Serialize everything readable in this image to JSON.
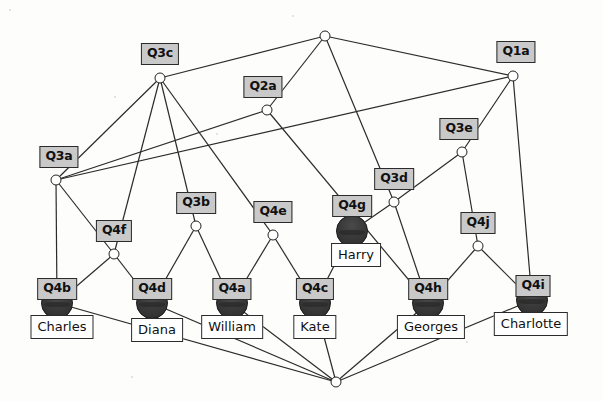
{
  "diagram": {
    "type": "graph",
    "colors": {
      "q_node_fill": "#c9c9c9",
      "name_node_fill": "#ffffff",
      "stroke": "#2b2b2b",
      "blob_fill": "#3a3a3a",
      "background": "#fdfdfb"
    },
    "nodes": [
      {
        "id": "top",
        "label": "",
        "kind": "junction",
        "x": 325,
        "y": 36,
        "label_x": 325,
        "label_y": 36
      },
      {
        "id": "Q3c",
        "label": "Q3c",
        "kind": "q",
        "x": 160,
        "y": 78,
        "label_x": 160,
        "label_y": 43
      },
      {
        "id": "Q1a",
        "label": "Q1a",
        "kind": "q",
        "x": 513,
        "y": 76,
        "label_x": 516,
        "label_y": 41
      },
      {
        "id": "Q2a",
        "label": "Q2a",
        "kind": "q",
        "x": 267,
        "y": 110,
        "label_x": 263,
        "label_y": 76
      },
      {
        "id": "Q3e",
        "label": "Q3e",
        "kind": "q",
        "x": 462,
        "y": 152,
        "label_x": 459,
        "label_y": 118
      },
      {
        "id": "Q3a",
        "label": "Q3a",
        "kind": "q",
        "x": 56,
        "y": 180,
        "label_x": 59,
        "label_y": 146
      },
      {
        "id": "Q3d",
        "label": "Q3d",
        "kind": "q",
        "x": 394,
        "y": 202,
        "label_x": 394,
        "label_y": 168
      },
      {
        "id": "Q3b",
        "label": "Q3b",
        "kind": "q",
        "x": 196,
        "y": 226,
        "label_x": 196,
        "label_y": 192
      },
      {
        "id": "Q4e",
        "label": "Q4e",
        "kind": "q",
        "x": 273,
        "y": 235,
        "label_x": 273,
        "label_y": 201
      },
      {
        "id": "Q4f",
        "label": "Q4f",
        "kind": "q",
        "x": 114,
        "y": 254,
        "label_x": 114,
        "label_y": 220
      },
      {
        "id": "Q4j",
        "label": "Q4j",
        "kind": "q",
        "x": 478,
        "y": 246,
        "label_x": 478,
        "label_y": 212
      },
      {
        "id": "Q4g",
        "label": "Q4g",
        "kind": "person",
        "x": 352,
        "y": 231,
        "label_x": 352,
        "label_y": 195,
        "name": "Harry",
        "name_x": 356,
        "name_y": 243
      },
      {
        "id": "Q4b",
        "label": "Q4b",
        "kind": "person",
        "x": 57,
        "y": 303,
        "label_x": 57,
        "label_y": 278,
        "name": "Charles",
        "name_x": 62,
        "name_y": 315
      },
      {
        "id": "Q4d",
        "label": "Q4d",
        "kind": "person",
        "x": 152,
        "y": 303,
        "label_x": 152,
        "label_y": 278,
        "name": "Diana",
        "name_x": 157,
        "name_y": 318
      },
      {
        "id": "Q4a",
        "label": "Q4a",
        "kind": "person",
        "x": 232,
        "y": 303,
        "label_x": 232,
        "label_y": 278,
        "name": "William",
        "name_x": 232,
        "name_y": 315
      },
      {
        "id": "Q4c",
        "label": "Q4c",
        "kind": "person",
        "x": 315,
        "y": 303,
        "label_x": 315,
        "label_y": 278,
        "name": "Kate",
        "name_x": 315,
        "name_y": 315
      },
      {
        "id": "Q4h",
        "label": "Q4h",
        "kind": "person",
        "x": 428,
        "y": 303,
        "label_x": 428,
        "label_y": 278,
        "name": "Georges",
        "name_x": 431,
        "name_y": 315
      },
      {
        "id": "Q4i",
        "label": "Q4i",
        "kind": "person",
        "x": 532,
        "y": 300,
        "label_x": 533,
        "label_y": 275,
        "name": "Charlotte",
        "name_x": 531,
        "name_y": 312
      },
      {
        "id": "bottom",
        "label": "",
        "kind": "junction",
        "x": 336,
        "y": 382,
        "label_x": 336,
        "label_y": 382
      }
    ],
    "edges": [
      {
        "from": "top",
        "to": "Q3c"
      },
      {
        "from": "top",
        "to": "Q1a"
      },
      {
        "from": "top",
        "to": "Q2a"
      },
      {
        "from": "top",
        "to": "Q3d"
      },
      {
        "from": "Q3c",
        "to": "Q3a"
      },
      {
        "from": "Q3c",
        "to": "Q4f"
      },
      {
        "from": "Q3c",
        "to": "Q3b"
      },
      {
        "from": "Q3c",
        "to": "Q4e"
      },
      {
        "from": "Q1a",
        "to": "Q3e"
      },
      {
        "from": "Q1a",
        "to": "Q3a"
      },
      {
        "from": "Q1a",
        "to": "Q4i"
      },
      {
        "from": "Q2a",
        "to": "Q3a"
      },
      {
        "from": "Q2a",
        "to": "Q4h"
      },
      {
        "from": "Q3e",
        "to": "Q3d"
      },
      {
        "from": "Q3e",
        "to": "Q4j"
      },
      {
        "from": "Q3a",
        "to": "Q4b"
      },
      {
        "from": "Q3a",
        "to": "Q4f"
      },
      {
        "from": "Q3d",
        "to": "Q4g"
      },
      {
        "from": "Q3d",
        "to": "Q4h"
      },
      {
        "from": "Q3b",
        "to": "Q4d"
      },
      {
        "from": "Q3b",
        "to": "Q4a"
      },
      {
        "from": "Q4e",
        "to": "Q4a"
      },
      {
        "from": "Q4e",
        "to": "Q4c"
      },
      {
        "from": "Q4f",
        "to": "Q4b"
      },
      {
        "from": "Q4f",
        "to": "Q4d"
      },
      {
        "from": "Q4j",
        "to": "Q4h"
      },
      {
        "from": "Q4j",
        "to": "Q4i"
      },
      {
        "from": "Q4g",
        "to": "Q4c"
      },
      {
        "from": "Q4b",
        "to": "bottom"
      },
      {
        "from": "Q4d",
        "to": "bottom"
      },
      {
        "from": "Q4a",
        "to": "bottom"
      },
      {
        "from": "Q4c",
        "to": "bottom"
      },
      {
        "from": "Q4h",
        "to": "bottom"
      },
      {
        "from": "Q4i",
        "to": "bottom"
      }
    ]
  }
}
